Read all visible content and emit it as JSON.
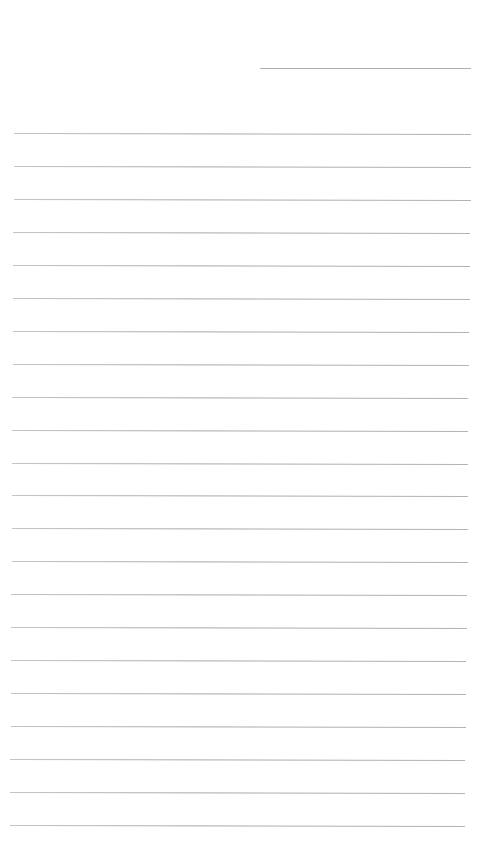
{
  "page": {
    "type": "lined-paper",
    "header_line": {
      "present": true,
      "label": ""
    },
    "ruled_line_count": 22,
    "lines": [
      "",
      "",
      "",
      "",
      "",
      "",
      "",
      "",
      "",
      "",
      "",
      "",
      "",
      "",
      "",
      "",
      "",
      "",
      "",
      "",
      "",
      ""
    ],
    "colors": {
      "paper": "#ffffff",
      "rule": "#b0b0b0"
    }
  }
}
